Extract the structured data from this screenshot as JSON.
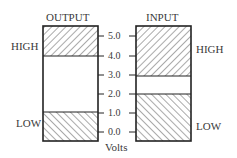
{
  "diagram": {
    "output": {
      "title": "OUTPUT",
      "high_label": "HIGH",
      "low_label": "LOW",
      "high_range_volts": [
        4.0,
        5.0
      ],
      "low_range_volts": [
        0.0,
        1.0
      ]
    },
    "input": {
      "title": "INPUT",
      "high_label": "HIGH",
      "low_label": "LOW",
      "high_range_volts": [
        3.0,
        5.0
      ],
      "low_range_volts": [
        0.0,
        2.0
      ]
    },
    "axis": {
      "label": "Volts",
      "ticks": [
        "5.0",
        "4.0",
        "3.0",
        "2.0",
        "1.0",
        "0.0"
      ]
    },
    "colors": {
      "line": "#222222",
      "hatch": "#444444",
      "text": "#3a3a3a"
    }
  }
}
